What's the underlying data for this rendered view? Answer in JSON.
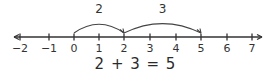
{
  "number_line": {
    "min": -2,
    "max": 7,
    "ticks": [
      {
        "value": -2,
        "label": "−2",
        "x": 20
      },
      {
        "value": -1,
        "label": "−1",
        "x": 49
      },
      {
        "value": 0,
        "label": "0",
        "x": 74
      },
      {
        "value": 1,
        "label": "1",
        "x": 99
      },
      {
        "value": 2,
        "label": "2",
        "x": 124
      },
      {
        "value": 3,
        "label": "3",
        "x": 150
      },
      {
        "value": 4,
        "label": "4",
        "x": 176
      },
      {
        "value": 5,
        "label": "5",
        "x": 201
      },
      {
        "value": 6,
        "label": "6",
        "x": 227
      },
      {
        "value": 7,
        "label": "7",
        "x": 252
      }
    ],
    "line_color": "#333333"
  },
  "jumps": [
    {
      "from": 0,
      "to": 2,
      "label": "2"
    },
    {
      "from": 2,
      "to": 5,
      "label": "3"
    }
  ],
  "equation": "2 + 3 = 5"
}
